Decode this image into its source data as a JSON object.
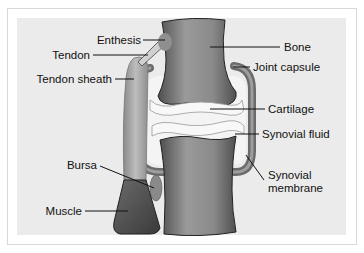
{
  "diagram": {
    "colors": {
      "panel_bg": "#ebebeb",
      "bone_dark": "#5e5e5e",
      "bone_light": "#a6a6a6",
      "cartilage": "#f0f0f0",
      "capsule": "#6f6f6f",
      "muscle": "#4a4a4a",
      "tendon_sheath": "#9c9c9c"
    },
    "labels": {
      "enthesis": "Enthesis",
      "tendon": "Tendon",
      "tendon_sheath": "Tendon sheath",
      "bone": "Bone",
      "joint_capsule": "Joint capsule",
      "cartilage": "Cartilage",
      "synovial_fluid": "Synovial fluid",
      "synovial_membrane_line1": "Synovial",
      "synovial_membrane_line2": "membrane",
      "bursa": "Bursa",
      "muscle": "Muscle"
    }
  }
}
